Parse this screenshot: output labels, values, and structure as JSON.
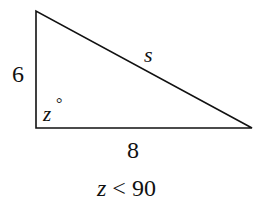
{
  "figure": {
    "type": "right-triangle",
    "vertices": {
      "top": [
        36,
        11
      ],
      "bottom_left": [
        36,
        128
      ],
      "bottom_right": [
        252,
        128
      ]
    },
    "stroke_color": "#111111",
    "labels": {
      "left_side": "6",
      "hypotenuse": "s",
      "angle_var": "z",
      "angle_degree": "°",
      "bottom_side": "8"
    },
    "condition": "z < 90"
  }
}
